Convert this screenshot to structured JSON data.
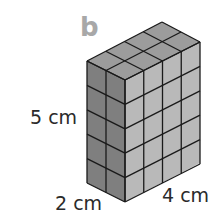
{
  "figure": {
    "part_label": "b",
    "dimensions": {
      "height": "5 cm",
      "depth": "2 cm",
      "width": "4 cm"
    },
    "cube_grid": {
      "height": 5,
      "depth": 2,
      "width": 4
    },
    "colors": {
      "left_face": "#808080",
      "right_face": "#b8b8b8",
      "top_face": "#9a9a9a",
      "edges": "#1a1a1a",
      "label": "#2a2a2a",
      "part_label": "#a8a8a8"
    }
  }
}
